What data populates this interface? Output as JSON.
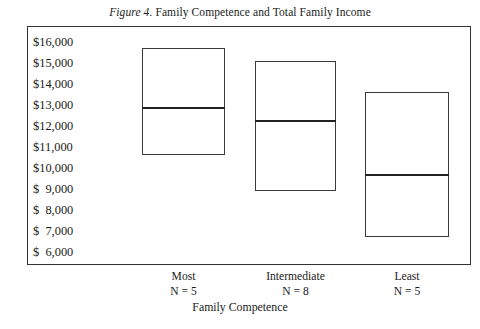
{
  "figure": {
    "label": "Figure 4.",
    "title": " Family Competence and Total Family Income"
  },
  "axes": {
    "y_title": "Total Family Income",
    "x_title": "Family Competence",
    "y_ticks": [
      "$16,000",
      "$15,000",
      "$14,000",
      "$13,000",
      "$12,000",
      "$11,000",
      "$10,000",
      "$  9,000",
      "$  8,000",
      "$  7,000",
      "$  6,000"
    ]
  },
  "groups": [
    {
      "name": "Most",
      "n_label": "N = 5"
    },
    {
      "name": "Intermediate",
      "n_label": "N = 8"
    },
    {
      "name": "Least",
      "n_label": "N = 5"
    }
  ],
  "chart_data": {
    "type": "bar",
    "title": "Figure 4. Family Competence and Total Family Income",
    "xlabel": "Family Competence",
    "ylabel": "Total Family Income",
    "ylim": [
      6000,
      16000
    ],
    "ytick_values": [
      16000,
      15000,
      14000,
      13000,
      12000,
      11000,
      10000,
      9000,
      8000,
      7000,
      6000
    ],
    "ytick_labels": [
      "$16,000",
      "$15,000",
      "$14,000",
      "$13,000",
      "$12,000",
      "$11,000",
      "$10,000",
      "$  9,000",
      "$  8,000",
      "$  7,000",
      "$  6,000"
    ],
    "grid": false,
    "legend": "none",
    "categories": [
      "Most",
      "Intermediate",
      "Least"
    ],
    "sample_sizes": [
      5,
      8,
      5
    ],
    "series": [
      {
        "name": "upper",
        "values": [
          15700,
          15100,
          13600
        ]
      },
      {
        "name": "median",
        "values": [
          12900,
          12300,
          9700
        ]
      },
      {
        "name": "lower",
        "values": [
          10600,
          8900,
          6700
        ]
      }
    ],
    "boxes": [
      {
        "category": "Most",
        "n": 5,
        "upper": 15700,
        "median": 12900,
        "lower": 10600
      },
      {
        "category": "Intermediate",
        "n": 8,
        "upper": 15100,
        "median": 12300,
        "lower": 8900
      },
      {
        "category": "Least",
        "n": 5,
        "upper": 13600,
        "median": 9700,
        "lower": 6700
      }
    ],
    "colors": {
      "line": "#333333",
      "median": "#222222",
      "background": "#ffffff"
    }
  }
}
